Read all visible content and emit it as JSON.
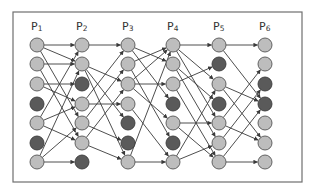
{
  "diagram": {
    "type": "layered-directed-graph",
    "columns": [
      {
        "label": "P",
        "sub": "1",
        "x": 37,
        "dark_rows": [
          3,
          5
        ]
      },
      {
        "label": "P",
        "sub": "2",
        "x": 82,
        "dark_rows": [
          2,
          6
        ]
      },
      {
        "label": "P",
        "sub": "3",
        "x": 128,
        "dark_rows": [
          4,
          5
        ]
      },
      {
        "label": "P",
        "sub": "4",
        "x": 173,
        "dark_rows": [
          3,
          5
        ]
      },
      {
        "label": "P",
        "sub": "5",
        "x": 219,
        "dark_rows": [
          1,
          3
        ]
      },
      {
        "label": "P",
        "sub": "6",
        "x": 265,
        "dark_rows": [
          2,
          3
        ]
      }
    ],
    "rows_y": [
      45,
      64,
      84,
      104,
      123,
      143,
      162
    ],
    "node_radius": 7,
    "label_y": 30,
    "frame": {
      "x": 13,
      "y": 12,
      "w": 289,
      "h": 170
    },
    "colors": {
      "light_node": "#bdbdbd",
      "dark_node": "#5a5a5a",
      "edge": "#3a3a3a"
    },
    "edges": [
      [
        [
          0,
          0
        ],
        [
          0,
          1
        ],
        [
          0,
          4
        ],
        [
          1,
          1
        ],
        [
          1,
          5
        ],
        [
          2,
          2
        ],
        [
          2,
          3
        ],
        [
          4,
          0
        ],
        [
          4,
          3
        ],
        [
          4,
          5
        ],
        [
          6,
          4
        ],
        [
          6,
          6
        ],
        [
          6,
          1
        ]
      ],
      [
        [
          0,
          0
        ],
        [
          1,
          2
        ],
        [
          1,
          4
        ],
        [
          1,
          6
        ],
        [
          3,
          3
        ],
        [
          3,
          0
        ],
        [
          4,
          1
        ],
        [
          4,
          5
        ],
        [
          5,
          6
        ],
        [
          5,
          2
        ]
      ],
      [
        [
          0,
          1
        ],
        [
          0,
          3
        ],
        [
          1,
          0
        ],
        [
          1,
          5
        ],
        [
          2,
          2
        ],
        [
          2,
          4
        ],
        [
          3,
          6
        ],
        [
          6,
          6
        ],
        [
          6,
          0
        ],
        [
          2,
          0
        ]
      ],
      [
        [
          0,
          0
        ],
        [
          0,
          2
        ],
        [
          0,
          4
        ],
        [
          1,
          3
        ],
        [
          1,
          5
        ],
        [
          2,
          1
        ],
        [
          4,
          4
        ],
        [
          4,
          6
        ],
        [
          6,
          5
        ],
        [
          6,
          2
        ],
        [
          2,
          6
        ]
      ],
      [
        [
          0,
          0
        ],
        [
          0,
          3
        ],
        [
          2,
          3
        ],
        [
          2,
          5
        ],
        [
          4,
          1
        ],
        [
          4,
          5
        ],
        [
          5,
          2
        ],
        [
          6,
          6
        ],
        [
          6,
          3
        ]
      ]
    ]
  }
}
